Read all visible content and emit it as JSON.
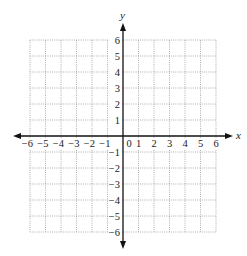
{
  "chart_data": {
    "type": "table",
    "title": "",
    "xlabel": "x",
    "ylabel": "y",
    "xlim": [
      -6,
      6
    ],
    "ylim": [
      -6,
      6
    ],
    "grid": true,
    "grid_style": "dotted",
    "x_ticks": [
      -6,
      -5,
      -4,
      -3,
      -2,
      -1,
      0,
      1,
      2,
      3,
      4,
      5,
      6
    ],
    "x_tick_labels": [
      "−6",
      "−5",
      "−4",
      "−3",
      "−2",
      "−1",
      "0",
      "1",
      "2",
      "3",
      "4",
      "5",
      "6"
    ],
    "y_ticks": [
      6,
      5,
      4,
      3,
      2,
      1,
      -1,
      -2,
      -3,
      -4,
      -5,
      -6
    ],
    "y_tick_labels": [
      "6",
      "5",
      "4",
      "3",
      "2",
      "1",
      "−1",
      "−2",
      "−3",
      "−4",
      "−5",
      "−6"
    ],
    "arrows": {
      "x_axis": "both",
      "y_axis": "both"
    },
    "series": []
  },
  "layout": {
    "x_px_per_unit": 15.5,
    "y_px_per_unit": 16,
    "origin_px": [
      123,
      136
    ],
    "colors": {
      "axis": "#111111",
      "grid": "#9a9a9a",
      "label": "#222222"
    }
  },
  "labels": {
    "x_axis": "x",
    "y_axis": "y",
    "origin": "0"
  }
}
